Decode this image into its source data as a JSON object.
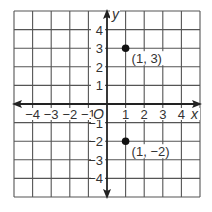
{
  "diagram": {
    "type": "coordinate-plane",
    "x_range": [
      -5,
      5
    ],
    "y_range": [
      -5,
      5
    ],
    "axis_labels": {
      "x": "x",
      "y": "y",
      "origin": "O"
    },
    "x_ticks": [
      {
        "value": -4,
        "label": "−4"
      },
      {
        "value": -3,
        "label": "−3"
      },
      {
        "value": -2,
        "label": "−2"
      },
      {
        "value": -1,
        "label": "−1"
      },
      {
        "value": 1,
        "label": "1"
      },
      {
        "value": 2,
        "label": "2"
      },
      {
        "value": 3,
        "label": "3"
      },
      {
        "value": 4,
        "label": "4"
      }
    ],
    "y_ticks": [
      {
        "value": 4,
        "label": "4"
      },
      {
        "value": 3,
        "label": "3"
      },
      {
        "value": 2,
        "label": "2"
      },
      {
        "value": 1,
        "label": "1"
      },
      {
        "value": -1,
        "label": "−1"
      },
      {
        "value": -2,
        "label": "−2"
      },
      {
        "value": -3,
        "label": "−3"
      },
      {
        "value": -4,
        "label": "−4"
      }
    ],
    "points": [
      {
        "x": 1,
        "y": 3,
        "label": "(1, 3)"
      },
      {
        "x": 1,
        "y": -2,
        "label": "(1, −2)"
      }
    ],
    "colors": {
      "grid": "#555555",
      "axis": "#222222",
      "point": "#111111",
      "text": "#333333"
    }
  }
}
